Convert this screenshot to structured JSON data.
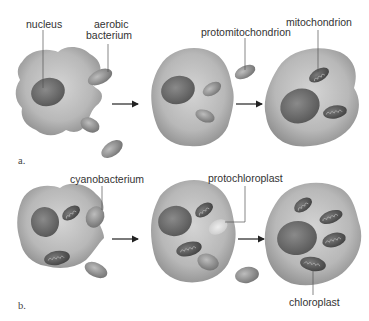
{
  "diagram": {
    "topic": "endosymbiosis",
    "panels": [
      {
        "id": "a",
        "panel_label": "a.",
        "labels": {
          "nucleus": "nucleus",
          "aerobic_bacterium_line1": "aerobic",
          "aerobic_bacterium_line2": "bacterium",
          "protomitochondrion": "protomitochondrion",
          "mitochondrion": "mitochondrion"
        }
      },
      {
        "id": "b",
        "panel_label": "b.",
        "labels": {
          "cyanobacterium": "cyanobacterium",
          "protochloroplast": "protochloroplast",
          "chloroplast": "chloroplast"
        }
      }
    ],
    "colors": {
      "cell_fill": "#b9b9b9",
      "cell_shade": "#8f8f8f",
      "nucleus": "#6e6e6e",
      "organelle": "#5a5a5a",
      "bacterium": "#9a9a9a",
      "leader_line": "#555555",
      "arrow": "#222222"
    }
  }
}
